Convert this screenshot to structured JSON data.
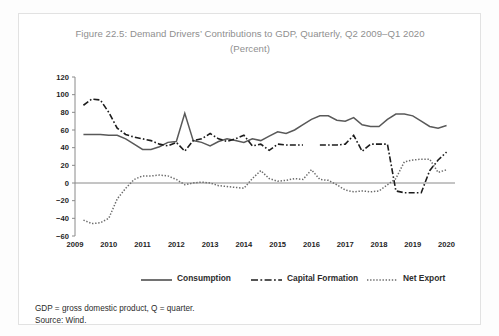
{
  "figure": {
    "title_line1": "Figure 22.5: Demand Drivers’ Contributions to GDP, Quarterly, Q2 2009–Q1 2020",
    "title_line2": "(Percent)",
    "title_color": "#8f8f8f"
  },
  "legend": {
    "position": "bottom",
    "items": [
      {
        "label": "Consumption",
        "style": "solid",
        "color": "#595959"
      },
      {
        "label": "Capital Formation",
        "style": "dashdot",
        "color": "#1c1c1c"
      },
      {
        "label": "Net Export",
        "style": "dotted",
        "color": "#6b6b6b"
      }
    ]
  },
  "footnotes": {
    "line1": "GDP = gross domestic product, Q = quarter.",
    "line2": "Source: Wind."
  },
  "chart_data": {
    "type": "line",
    "title": "Figure 22.5: Demand Drivers’ Contributions to GDP, Quarterly, Q2 2009–Q1 2020 (Percent)",
    "xlabel": "",
    "ylabel": "",
    "ylim": [
      -60,
      120
    ],
    "yticks": [
      -60,
      -40,
      -20,
      0,
      20,
      40,
      60,
      80,
      100,
      120
    ],
    "ytick_labels": [
      "−60",
      "−40",
      "−20",
      "0",
      "20",
      "40",
      "60",
      "80",
      "100",
      "120"
    ],
    "xlim": [
      2009.0,
      2020.25
    ],
    "xticks": [
      2009,
      2010,
      2011,
      2012,
      2013,
      2014,
      2015,
      2016,
      2017,
      2018,
      2019,
      2020
    ],
    "xtick_labels": [
      "2009",
      "2010",
      "2011",
      "2012",
      "2013",
      "2014",
      "2015",
      "2016",
      "2017",
      "2018",
      "2019",
      "2020"
    ],
    "grid": false,
    "zero_line": true,
    "x": [
      2009.25,
      2009.5,
      2009.75,
      2010.0,
      2010.25,
      2010.5,
      2010.75,
      2011.0,
      2011.25,
      2011.5,
      2011.75,
      2012.0,
      2012.25,
      2012.5,
      2012.75,
      2013.0,
      2013.25,
      2013.5,
      2013.75,
      2014.0,
      2014.25,
      2014.5,
      2014.75,
      2015.0,
      2015.25,
      2015.5,
      2015.75,
      2016.0,
      2016.25,
      2016.5,
      2016.75,
      2017.0,
      2017.25,
      2017.5,
      2017.75,
      2018.0,
      2018.25,
      2018.5,
      2018.75,
      2019.0,
      2019.25,
      2019.5,
      2019.75,
      2020.0
    ],
    "x_quarter_labels": [
      "Q2 2009",
      "Q3 2009",
      "Q4 2009",
      "Q1 2010",
      "Q2 2010",
      "Q3 2010",
      "Q4 2010",
      "Q1 2011",
      "Q2 2011",
      "Q3 2011",
      "Q4 2011",
      "Q1 2012",
      "Q2 2012",
      "Q3 2012",
      "Q4 2012",
      "Q1 2013",
      "Q2 2013",
      "Q3 2013",
      "Q4 2013",
      "Q1 2014",
      "Q2 2014",
      "Q3 2014",
      "Q4 2014",
      "Q1 2015",
      "Q2 2015",
      "Q3 2015",
      "Q4 2015",
      "Q1 2016",
      "Q2 2016",
      "Q3 2016",
      "Q4 2016",
      "Q1 2017",
      "Q2 2017",
      "Q3 2017",
      "Q4 2017",
      "Q1 2018",
      "Q2 2018",
      "Q3 2018",
      "Q4 2018",
      "Q1 2019",
      "Q2 2019",
      "Q3 2019",
      "Q4 2019",
      "Q1 2020"
    ],
    "series": [
      {
        "name": "Consumption",
        "style": "solid",
        "color": "#595959",
        "values": [
          55,
          55,
          55,
          54,
          54,
          50,
          44,
          38,
          38,
          41,
          46,
          47,
          79,
          48,
          46,
          42,
          47,
          50,
          48,
          46,
          50,
          48,
          53,
          58,
          56,
          60,
          66,
          72,
          76,
          76,
          71,
          70,
          74,
          66,
          64,
          64,
          72,
          78,
          78,
          76,
          70,
          64,
          62,
          65
        ]
      },
      {
        "name": "Capital Formation",
        "style": "dashdot",
        "color": "#1c1c1c",
        "values": [
          88,
          95,
          94,
          80,
          62,
          55,
          52,
          50,
          48,
          44,
          42,
          46,
          36,
          48,
          50,
          56,
          50,
          47,
          50,
          54,
          42,
          44,
          37,
          44,
          43,
          43,
          43,
          null,
          43,
          43,
          43,
          44,
          54,
          36,
          44,
          44,
          44,
          -9,
          -11,
          -11,
          -11,
          14,
          26,
          35
        ]
      },
      {
        "name": "Net Export",
        "style": "dotted",
        "color": "#6b6b6b",
        "values": [
          -42,
          -46,
          -45,
          -40,
          -18,
          -6,
          4,
          8,
          8,
          9,
          8,
          4,
          -2,
          0,
          1,
          0,
          -3,
          -4,
          -5,
          -6,
          5,
          14,
          5,
          2,
          3,
          5,
          4,
          15,
          4,
          3,
          -2,
          -8,
          -10,
          -9,
          -10,
          -9,
          -2,
          5,
          24,
          26,
          27,
          27,
          12,
          15
        ]
      }
    ]
  }
}
